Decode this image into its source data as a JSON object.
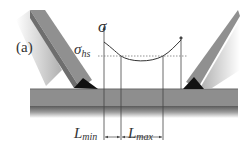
{
  "figure": {
    "panel_label": "(a)",
    "axis_label": "σ",
    "hotspot_label": {
      "base": "σ",
      "sub": "hs"
    },
    "dimension_labels": [
      {
        "base": "L",
        "sub": "min"
      },
      {
        "base": "L",
        "sub": "max"
      }
    ],
    "colors": {
      "plate": "#8c8c8c",
      "plate_dark": "#555555",
      "weld": "#111111",
      "lines": "#444444",
      "background": "#ffffff"
    }
  }
}
